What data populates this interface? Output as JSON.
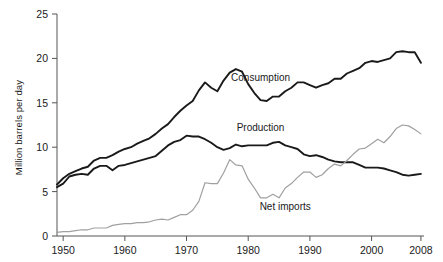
{
  "chart_data": {
    "type": "line",
    "title": "",
    "subtitle": "",
    "xlabel": "",
    "ylabel": "Million barrels per day",
    "xlim": [
      1949,
      2008.5
    ],
    "ylim": [
      0,
      25
    ],
    "yticks": [
      0,
      5,
      10,
      15,
      20,
      25
    ],
    "ytick_labels": [
      "0",
      "5",
      "10",
      "15",
      "20",
      "25"
    ],
    "xticks": [
      1950,
      1960,
      1970,
      1980,
      1990,
      2000,
      2008
    ],
    "xtick_labels": [
      "1950",
      "1960",
      "1970",
      "1980",
      "1990",
      "2000",
      "2008"
    ],
    "grid": false,
    "legend": "inline-annotations",
    "x": [
      1949,
      1950,
      1951,
      1952,
      1953,
      1954,
      1955,
      1956,
      1957,
      1958,
      1959,
      1960,
      1961,
      1962,
      1963,
      1964,
      1965,
      1966,
      1967,
      1968,
      1969,
      1970,
      1971,
      1972,
      1973,
      1974,
      1975,
      1976,
      1977,
      1978,
      1979,
      1980,
      1981,
      1982,
      1983,
      1984,
      1985,
      1986,
      1987,
      1988,
      1989,
      1990,
      1991,
      1992,
      1993,
      1994,
      1995,
      1996,
      1997,
      1998,
      1999,
      2000,
      2001,
      2002,
      2003,
      2004,
      2005,
      2006,
      2007,
      2008
    ],
    "series": [
      {
        "name": "Consumption",
        "color": "#1a1a1a",
        "label_x": 1982,
        "label_y": 17.5,
        "values": [
          5.8,
          6.5,
          7.0,
          7.3,
          7.6,
          7.8,
          8.5,
          8.8,
          8.8,
          9.1,
          9.5,
          9.8,
          10.0,
          10.4,
          10.7,
          11.0,
          11.5,
          12.1,
          12.6,
          13.4,
          14.1,
          14.7,
          15.2,
          16.4,
          17.3,
          16.7,
          16.3,
          17.5,
          18.4,
          18.8,
          18.5,
          17.1,
          16.1,
          15.3,
          15.2,
          15.7,
          15.7,
          16.3,
          16.7,
          17.3,
          17.3,
          17.0,
          16.7,
          17.0,
          17.2,
          17.7,
          17.7,
          18.3,
          18.6,
          18.9,
          19.5,
          19.7,
          19.6,
          19.8,
          20.0,
          20.7,
          20.8,
          20.7,
          20.7,
          19.5
        ]
      },
      {
        "name": "Production",
        "color": "#1a1a1a",
        "label_x": 1982,
        "label_y": 11.8,
        "values": [
          5.5,
          5.9,
          6.7,
          6.9,
          7.0,
          6.9,
          7.6,
          7.9,
          7.9,
          7.4,
          7.9,
          8.0,
          8.2,
          8.4,
          8.6,
          8.8,
          9.0,
          9.6,
          10.2,
          10.6,
          10.8,
          11.3,
          11.2,
          11.2,
          10.9,
          10.5,
          10.0,
          9.7,
          9.9,
          10.3,
          10.1,
          10.2,
          10.2,
          10.2,
          10.2,
          10.5,
          10.6,
          10.2,
          10.0,
          9.8,
          9.2,
          9.0,
          9.1,
          8.9,
          8.6,
          8.4,
          8.3,
          8.3,
          8.3,
          8.0,
          7.7,
          7.7,
          7.7,
          7.6,
          7.4,
          7.2,
          6.9,
          6.8,
          6.9,
          7.0
        ]
      },
      {
        "name": "Net imports",
        "color": "#a0a0a0",
        "label_x": 1986,
        "label_y": 2.9,
        "values": [
          0.4,
          0.5,
          0.5,
          0.6,
          0.7,
          0.7,
          0.9,
          0.9,
          0.9,
          1.2,
          1.3,
          1.4,
          1.4,
          1.5,
          1.5,
          1.6,
          1.8,
          1.9,
          1.8,
          2.1,
          2.4,
          2.4,
          2.9,
          3.9,
          6.0,
          5.9,
          5.9,
          7.1,
          8.6,
          8.0,
          7.9,
          6.4,
          5.4,
          4.3,
          4.3,
          4.7,
          4.3,
          5.4,
          5.9,
          6.6,
          7.2,
          7.2,
          6.6,
          6.9,
          7.6,
          8.1,
          7.9,
          8.5,
          9.2,
          9.8,
          9.9,
          10.4,
          10.9,
          10.5,
          11.2,
          12.1,
          12.5,
          12.4,
          12.0,
          11.5
        ]
      }
    ]
  },
  "axis": {
    "y_axis_title": "Million barrels per day"
  }
}
